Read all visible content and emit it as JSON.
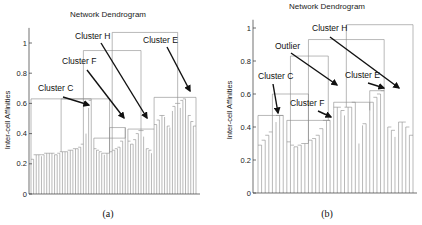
{
  "chart_data": [
    {
      "type": "dendrogram",
      "panel": "a",
      "title": "Network Dendrogram",
      "xlabel": "",
      "ylabel": "Inter-cell Affinities",
      "caption": "(a)",
      "ylim": [
        0,
        1.1
      ],
      "yticks": [
        "0",
        "0.2",
        "0.4",
        "0.6",
        "0.8",
        "1"
      ],
      "ytick_values": [
        0,
        0.2,
        0.4,
        0.6,
        0.8,
        1.0
      ],
      "grid": false,
      "leaf_count": 64,
      "leaf_heights": [
        0.22,
        0.23,
        0.26,
        0.26,
        0.25,
        0.26,
        0.27,
        0.27,
        0.27,
        0.26,
        0.26,
        0.27,
        0.28,
        0.28,
        0.28,
        0.29,
        0.29,
        0.3,
        0.3,
        0.31,
        0.33,
        0.4,
        0.57,
        0.62,
        0.3,
        0.29,
        0.28,
        0.27,
        0.26,
        0.27,
        0.27,
        0.28,
        0.29,
        0.3,
        0.31,
        0.35,
        0.44,
        0.35,
        0.33,
        0.33,
        0.36,
        0.4,
        0.42,
        0.38,
        0.3,
        0.29,
        0.27,
        0.43,
        0.46,
        0.49,
        0.52,
        0.51,
        0.45,
        0.44,
        0.55,
        0.58,
        0.6,
        0.57,
        0.62,
        0.63,
        0.52,
        0.48,
        0.45,
        0.42
      ],
      "merge_links": [
        {
          "from": 0.0,
          "to": 23.0,
          "height": 0.63,
          "label": "Cluster C branch"
        },
        {
          "from": 24.0,
          "to": 36.0,
          "height": 0.37
        },
        {
          "from": 30.0,
          "to": 36.0,
          "height": 0.44
        },
        {
          "from": 11.5,
          "to": 30.0,
          "height": 0.63
        },
        {
          "from": 37.0,
          "to": 47.0,
          "height": 0.43
        },
        {
          "from": 20.0,
          "to": 42.0,
          "height": 0.95
        },
        {
          "from": 47.0,
          "to": 63.0,
          "height": 0.64
        },
        {
          "from": 31.0,
          "to": 56.0,
          "height": 1.07
        }
      ],
      "annotations": [
        {
          "text": "Cluster C",
          "points_to_value": 0.6
        },
        {
          "text": "Cluster F",
          "points_to_value": 0.48
        },
        {
          "text": "Cluster H",
          "points_to_value": 0.42
        },
        {
          "text": "Cluster E",
          "points_to_value": 0.64
        }
      ]
    },
    {
      "type": "dendrogram",
      "panel": "b",
      "title": "Network Dendrogram",
      "xlabel": "",
      "ylabel": "Inter-cell Affinities",
      "caption": "(b)",
      "ylim": [
        0,
        1.05
      ],
      "yticks": [
        "0",
        "0.2",
        "0.4",
        "0.6",
        "0.8",
        "1"
      ],
      "ytick_values": [
        0,
        0.2,
        0.4,
        0.6,
        0.8,
        1.0
      ],
      "grid": false,
      "leaf_count": 44,
      "leaf_heights": [
        0.28,
        0.29,
        0.32,
        0.35,
        0.37,
        0.43,
        0.47,
        0.47,
        0.31,
        0.29,
        0.28,
        0.28,
        0.29,
        0.3,
        0.3,
        0.32,
        0.33,
        0.35,
        0.39,
        0.44,
        0.44,
        0.5,
        0.52,
        0.5,
        0.47,
        0.52,
        0.52,
        0.55,
        0.3,
        0.41,
        0.42,
        0.5,
        0.55,
        0.58,
        0.6,
        0.62,
        0.4,
        0.38,
        0.34,
        0.43,
        0.43,
        0.4,
        0.35,
        0.33
      ],
      "merge_links": [
        {
          "from": 0.0,
          "to": 7.0,
          "height": 0.47
        },
        {
          "from": 8.0,
          "to": 20.0,
          "height": 0.44
        },
        {
          "from": 4.0,
          "to": 14.0,
          "height": 0.6,
          "label": "Cluster C + Cluster F"
        },
        {
          "from": 21.0,
          "to": 31.0,
          "height": 0.55
        },
        {
          "from": 31.0,
          "to": 35.0,
          "height": 0.62
        },
        {
          "from": 9.0,
          "to": 19.5,
          "height": 0.83
        },
        {
          "from": 14.0,
          "to": 35.0,
          "height": 0.93,
          "label": "Outlier merge"
        },
        {
          "from": 24.5,
          "to": 43.0,
          "height": 1.02
        }
      ],
      "annotations": [
        {
          "text": "Cluster C",
          "points_to_value": 0.49
        },
        {
          "text": "Cluster F",
          "points_to_value": 0.44
        },
        {
          "text": "Outlier",
          "points_to_value": 0.57
        },
        {
          "text": "Cluster E",
          "points_to_value": 0.62
        },
        {
          "text": "Cluster H",
          "points_to_value": 0.6
        }
      ]
    }
  ]
}
